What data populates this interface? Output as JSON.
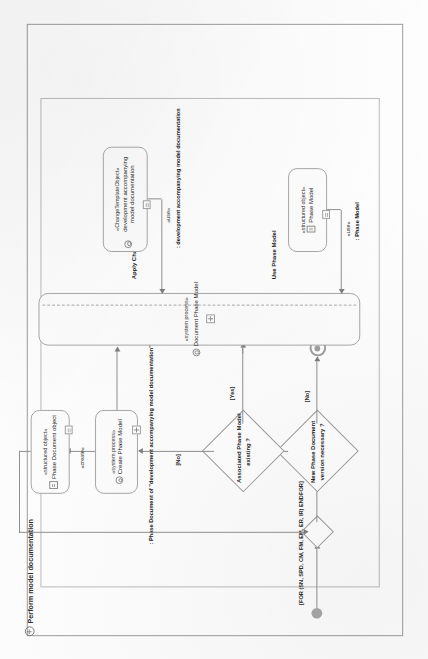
{
  "document": {
    "kind": "UML activity diagram (scanned page, rotated 90°)",
    "frame_title": "Perform model documentation"
  },
  "colors": {
    "line": "#8e8e8e",
    "node_border": "#a5a5a5",
    "node_fill": "#fdfdfd",
    "text": "#1f1f1f",
    "page": "#fdfdfd"
  },
  "nodes": {
    "start": {
      "name": "initial-node"
    },
    "final": {
      "name": "activity-final-node"
    },
    "decision_version": {
      "label": "New Phase Document\nversion necessary ?",
      "line1": "New Phase Document",
      "line2": "version necessary ?"
    },
    "decision_model": {
      "label": "Associated Phase Model\nexisting ?",
      "line1": "Associated Phase Model",
      "line2": "existing ?"
    },
    "phase_document_object": {
      "stereotype": "«structured object»",
      "label": "Phase Document object"
    },
    "create_phase_model": {
      "stereotype": "«system process»",
      "label": "Create Phase Model"
    },
    "document_phase_model": {
      "stereotype": "«system process»",
      "label": "Document Phase Model"
    },
    "change_template_object": {
      "stereotype": "«ChangeTemplateObject»",
      "label": "development accompanying model documentation"
    },
    "phase_model_object": {
      "stereotype": "«structured object»",
      "label": "Phase Model"
    }
  },
  "edges": {
    "for_guard": "[FOR (SN, SPD, CM, FM, EM, ER, IR) ENDFOR]",
    "version_yes": "[Yes]",
    "version_no": "[No]",
    "model_yes_up": "[Yes]",
    "model_yes_right": "[Yes]",
    "model_no": "[No]"
  },
  "object_flows": {
    "create_stereotype": "«create»",
    "create_text": ": Phase Document of \"development accompanying model documentation\"",
    "use_template_stereotype": "«use»",
    "use_template_text": ": development accompanying model documentation",
    "use_model_stereotype": "«use»",
    "use_model_text": ": Phase Model"
  },
  "region_labels": {
    "apply_change_template": "Apply Change Template",
    "use_phase_model": "Use Phase Model"
  }
}
